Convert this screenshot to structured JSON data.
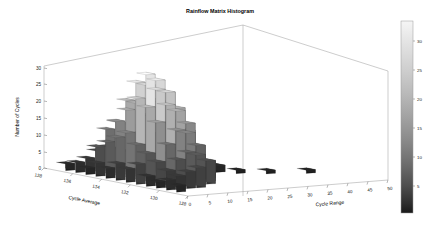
{
  "figure": {
    "title": "Rainflow Matrix Histogram",
    "background_color": "#ffffff",
    "frame_color": "#9a9a9a"
  },
  "chart_data": {
    "type": "bar",
    "subtype": "3d-bar-histogram",
    "title": "Rainflow Matrix Histogram",
    "xlabel": "Cycle Range",
    "ylabel": "Cycle Average",
    "zlabel": "Number of Cycles",
    "grid": false,
    "legend": "none",
    "colormap": "gray",
    "xlim": [
      0,
      50
    ],
    "ylim": [
      128,
      138
    ],
    "zlim": [
      0,
      32
    ],
    "x_ticks": [
      0,
      5,
      10,
      15,
      20,
      25,
      30,
      35,
      40,
      45,
      50
    ],
    "y_ticks": [
      138,
      136,
      134,
      132,
      130,
      128
    ],
    "z_ticks": [
      0,
      5,
      10,
      15,
      20,
      25,
      30
    ],
    "colorbar": {
      "ticks": [
        5,
        10,
        15,
        20,
        25,
        30
      ],
      "min": 0,
      "max": 32,
      "orientation": "vertical",
      "position": "right",
      "top_color": "#f2f2f2",
      "bottom_color": "#1b1b1b"
    },
    "x_label_text": "Cycle Range",
    "y_label_text": "Cycle Average",
    "z_label_text": "Number of Cycles",
    "bars": [
      {
        "range": 2.5,
        "avg": 137.2,
        "count": 2
      },
      {
        "range": 2.5,
        "avg": 136.5,
        "count": 3
      },
      {
        "range": 2.5,
        "avg": 135.8,
        "count": 2
      },
      {
        "range": 2.5,
        "avg": 135.1,
        "count": 4
      },
      {
        "range": 2.5,
        "avg": 134.4,
        "count": 3
      },
      {
        "range": 2.5,
        "avg": 133.7,
        "count": 5
      },
      {
        "range": 2.5,
        "avg": 133.0,
        "count": 4
      },
      {
        "range": 2.5,
        "avg": 132.3,
        "count": 6
      },
      {
        "range": 2.5,
        "avg": 131.6,
        "count": 3
      },
      {
        "range": 2.5,
        "avg": 130.9,
        "count": 2
      },
      {
        "range": 2.5,
        "avg": 130.2,
        "count": 3
      },
      {
        "range": 2.5,
        "avg": 129.5,
        "count": 2
      },
      {
        "range": 5.0,
        "avg": 136.5,
        "count": 4
      },
      {
        "range": 5.0,
        "avg": 135.8,
        "count": 8
      },
      {
        "range": 5.0,
        "avg": 135.1,
        "count": 10
      },
      {
        "range": 5.0,
        "avg": 134.4,
        "count": 12
      },
      {
        "range": 5.0,
        "avg": 133.7,
        "count": 14
      },
      {
        "range": 5.0,
        "avg": 133.0,
        "count": 11
      },
      {
        "range": 5.0,
        "avg": 132.3,
        "count": 9
      },
      {
        "range": 5.0,
        "avg": 131.6,
        "count": 7
      },
      {
        "range": 5.0,
        "avg": 130.9,
        "count": 5
      },
      {
        "range": 5.0,
        "avg": 130.2,
        "count": 4
      },
      {
        "range": 7.5,
        "avg": 136.5,
        "count": 6
      },
      {
        "range": 7.5,
        "avg": 135.8,
        "count": 13
      },
      {
        "range": 7.5,
        "avg": 135.1,
        "count": 16
      },
      {
        "range": 7.5,
        "avg": 134.4,
        "count": 20
      },
      {
        "range": 7.5,
        "avg": 133.7,
        "count": 24
      },
      {
        "range": 7.5,
        "avg": 133.0,
        "count": 22
      },
      {
        "range": 7.5,
        "avg": 132.3,
        "count": 18
      },
      {
        "range": 7.5,
        "avg": 131.6,
        "count": 12
      },
      {
        "range": 7.5,
        "avg": 130.9,
        "count": 8
      },
      {
        "range": 7.5,
        "avg": 130.2,
        "count": 5
      },
      {
        "range": 10.0,
        "avg": 136.5,
        "count": 7
      },
      {
        "range": 10.0,
        "avg": 135.8,
        "count": 15
      },
      {
        "range": 10.0,
        "avg": 135.1,
        "count": 22
      },
      {
        "range": 10.0,
        "avg": 134.4,
        "count": 28
      },
      {
        "range": 10.0,
        "avg": 133.7,
        "count": 31
      },
      {
        "range": 10.0,
        "avg": 133.0,
        "count": 27
      },
      {
        "range": 10.0,
        "avg": 132.3,
        "count": 23
      },
      {
        "range": 10.0,
        "avg": 131.6,
        "count": 16
      },
      {
        "range": 10.0,
        "avg": 130.9,
        "count": 10
      },
      {
        "range": 10.0,
        "avg": 130.2,
        "count": 6
      },
      {
        "range": 12.5,
        "avg": 136.5,
        "count": 6
      },
      {
        "range": 12.5,
        "avg": 135.8,
        "count": 14
      },
      {
        "range": 12.5,
        "avg": 135.1,
        "count": 21
      },
      {
        "range": 12.5,
        "avg": 134.4,
        "count": 27
      },
      {
        "range": 12.5,
        "avg": 133.7,
        "count": 29
      },
      {
        "range": 12.5,
        "avg": 133.0,
        "count": 26
      },
      {
        "range": 12.5,
        "avg": 132.3,
        "count": 21
      },
      {
        "range": 12.5,
        "avg": 131.6,
        "count": 15
      },
      {
        "range": 12.5,
        "avg": 130.9,
        "count": 9
      },
      {
        "range": 15.0,
        "avg": 136.5,
        "count": 5
      },
      {
        "range": 15.0,
        "avg": 135.8,
        "count": 11
      },
      {
        "range": 15.0,
        "avg": 135.1,
        "count": 17
      },
      {
        "range": 15.0,
        "avg": 134.4,
        "count": 22
      },
      {
        "range": 15.0,
        "avg": 133.7,
        "count": 25
      },
      {
        "range": 15.0,
        "avg": 133.0,
        "count": 21
      },
      {
        "range": 15.0,
        "avg": 132.3,
        "count": 17
      },
      {
        "range": 15.0,
        "avg": 131.6,
        "count": 11
      },
      {
        "range": 15.0,
        "avg": 130.9,
        "count": 7
      },
      {
        "range": 17.5,
        "avg": 135.8,
        "count": 7
      },
      {
        "range": 17.5,
        "avg": 135.1,
        "count": 11
      },
      {
        "range": 17.5,
        "avg": 134.4,
        "count": 15
      },
      {
        "range": 17.5,
        "avg": 133.7,
        "count": 16
      },
      {
        "range": 17.5,
        "avg": 133.0,
        "count": 14
      },
      {
        "range": 17.5,
        "avg": 132.3,
        "count": 10
      },
      {
        "range": 17.5,
        "avg": 131.6,
        "count": 6
      },
      {
        "range": 20.0,
        "avg": 135.1,
        "count": 5
      },
      {
        "range": 20.0,
        "avg": 134.4,
        "count": 7
      },
      {
        "range": 20.0,
        "avg": 133.7,
        "count": 8
      },
      {
        "range": 20.0,
        "avg": 133.0,
        "count": 6
      },
      {
        "range": 20.0,
        "avg": 132.3,
        "count": 4
      },
      {
        "range": 22.5,
        "avg": 134.4,
        "count": 3
      },
      {
        "range": 22.5,
        "avg": 133.7,
        "count": 4
      },
      {
        "range": 22.5,
        "avg": 133.0,
        "count": 3
      },
      {
        "range": 25.0,
        "avg": 133.7,
        "count": 2
      },
      {
        "range": 27.5,
        "avg": 133.7,
        "count": 2
      },
      {
        "range": 30.0,
        "avg": 133.0,
        "count": 1
      },
      {
        "range": 35.0,
        "avg": 132.3,
        "count": 1
      },
      {
        "range": 42.5,
        "avg": 131.6,
        "count": 1
      }
    ]
  },
  "axes": {
    "z_tick_labels": [
      "30",
      "25",
      "20",
      "15",
      "10",
      "5",
      "0"
    ],
    "y_tick_labels": [
      "138",
      "136",
      "134",
      "132",
      "130",
      "128"
    ],
    "x_tick_labels": [
      "0",
      "5",
      "10",
      "15",
      "20",
      "25",
      "30",
      "35",
      "40",
      "45",
      "50"
    ],
    "z_axis_title": "Number of Cycles",
    "y_axis_title": "Cycle Average",
    "x_axis_title": "Cycle Range"
  },
  "colorbar": {
    "tick_labels": [
      "30",
      "25",
      "20",
      "15",
      "10",
      "5"
    ]
  }
}
